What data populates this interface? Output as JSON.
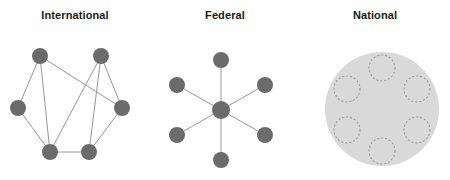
{
  "figure": {
    "width": 450,
    "height": 180,
    "background": "#ffffff",
    "panel_count": 3
  },
  "style": {
    "node_fill": "#6b6b6b",
    "edge_stroke": "#8a8a8a",
    "edge_width": 0.9,
    "title_color": "#1a1a1a",
    "region_fill": "#d9d9d9",
    "dashed_stroke": "#9a9a9a",
    "dashed_width": 1.1,
    "dash_pattern": "2,2"
  },
  "panels": [
    {
      "id": "international",
      "title": "International",
      "diagram_type": "mesh-network",
      "node_radius": 8,
      "nodes": [
        {
          "id": "n1",
          "x": 40,
          "y": 56
        },
        {
          "id": "n2",
          "x": 101,
          "y": 56
        },
        {
          "id": "n3",
          "x": 18,
          "y": 108
        },
        {
          "id": "n4",
          "x": 122,
          "y": 108
        },
        {
          "id": "n5",
          "x": 50,
          "y": 152
        },
        {
          "id": "n6",
          "x": 89,
          "y": 152
        }
      ],
      "edges": [
        {
          "from": "n1",
          "to": "n3"
        },
        {
          "from": "n1",
          "to": "n5"
        },
        {
          "from": "n1",
          "to": "n4"
        },
        {
          "from": "n2",
          "to": "n4"
        },
        {
          "from": "n2",
          "to": "n5"
        },
        {
          "from": "n2",
          "to": "n6"
        },
        {
          "from": "n3",
          "to": "n5"
        },
        {
          "from": "n4",
          "to": "n6"
        },
        {
          "from": "n5",
          "to": "n6"
        }
      ]
    },
    {
      "id": "federal",
      "title": "Federal",
      "diagram_type": "star-network",
      "hub_radius": 9,
      "spoke_radius": 8,
      "hub": {
        "id": "hub",
        "x": 71,
        "y": 110
      },
      "nodes": [
        {
          "id": "s1",
          "x": 71,
          "y": 60
        },
        {
          "id": "s2",
          "x": 27,
          "y": 85
        },
        {
          "id": "s3",
          "x": 115,
          "y": 85
        },
        {
          "id": "s4",
          "x": 27,
          "y": 135
        },
        {
          "id": "s5",
          "x": 115,
          "y": 135
        },
        {
          "id": "s6",
          "x": 71,
          "y": 160
        }
      ],
      "edges": [
        {
          "from": "hub",
          "to": "s1"
        },
        {
          "from": "hub",
          "to": "s2"
        },
        {
          "from": "hub",
          "to": "s3"
        },
        {
          "from": "hub",
          "to": "s4"
        },
        {
          "from": "hub",
          "to": "s5"
        },
        {
          "from": "hub",
          "to": "s6"
        }
      ]
    },
    {
      "id": "national",
      "title": "National",
      "diagram_type": "enclosed-region",
      "region": {
        "x": 82,
        "y": 109,
        "r": 57
      },
      "inner_radius": 13,
      "nodes": [
        {
          "id": "d1",
          "x": 82,
          "y": 68
        },
        {
          "id": "d2",
          "x": 47,
          "y": 89
        },
        {
          "id": "d3",
          "x": 117,
          "y": 89
        },
        {
          "id": "d4",
          "x": 47,
          "y": 130
        },
        {
          "id": "d5",
          "x": 117,
          "y": 130
        },
        {
          "id": "d6",
          "x": 82,
          "y": 151
        }
      ]
    }
  ]
}
